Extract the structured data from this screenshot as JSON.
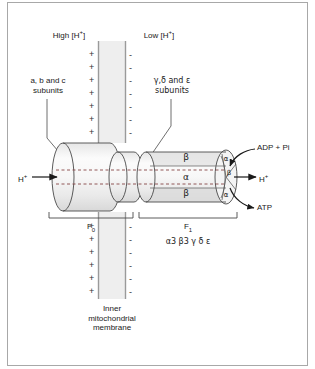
{
  "figure": {
    "colors": {
      "stroke": "#333333",
      "membrane_fill": "#eeeeee",
      "membrane_edge": "#9a9a9a",
      "cylinder_light": "#fdfdfd",
      "cylinder_shade": "#e2e2e2",
      "border": "#a8a8a8",
      "background": "#ffffff"
    }
  },
  "labels": {
    "high_proton": "High [H",
    "high_proton_sup": "+",
    "high_proton_end": "]",
    "low_proton": "Low [H",
    "low_proton_sup": "+",
    "low_proton_end": "]",
    "fo_subunits_line1": "a, b and c",
    "fo_subunits_line2": "subunits",
    "f1_subunits_line1": "γ,δ and ε",
    "f1_subunits_line2": "subunits",
    "proton_in": "H",
    "proton_in_sup": "+",
    "proton_out": "H",
    "proton_out_sup": "+",
    "substrate": "ADP + Pi",
    "product": "ATP",
    "fo_name": "F",
    "fo_sub": "0",
    "f1_name": "F",
    "f1_sub": "1",
    "f1_composition": "α3 β3 γ δ ε",
    "membrane_line1": "Inner",
    "membrane_line2": "mitochondrial",
    "membrane_line3": "membrane"
  },
  "subunits": {
    "f1_top": "β",
    "f1_middle": "α",
    "f1_bottom": "β",
    "cap_top": "α",
    "cap_middle": "β",
    "cap_bottom": "α"
  },
  "charges": {
    "positive": "+",
    "negative": "-",
    "upper_count": 7,
    "lower_count": 6,
    "upper_y": [
      50,
      63,
      76,
      89,
      102,
      115,
      128
    ],
    "lower_y": [
      222,
      235,
      248,
      261,
      274,
      287
    ]
  }
}
